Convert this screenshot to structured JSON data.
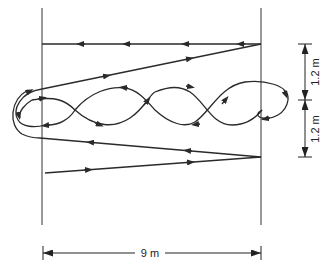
{
  "diagram": {
    "type": "movement-path-drill",
    "colors": {
      "line": "#2a2a2a",
      "background": "#ffffff"
    },
    "dimensions": {
      "width_label": "9 m",
      "upper_height_label": "1.2 m",
      "lower_height_label": "1.2 m"
    },
    "paths": [
      {
        "name": "top-return-line",
        "direction": "right-to-left",
        "arrow_count": 4
      },
      {
        "name": "upper-diagonal",
        "direction": "left-to-right",
        "arrow_count": 2
      },
      {
        "name": "figure-eight-weave",
        "loops": 3,
        "direction": "mixed"
      },
      {
        "name": "lower-return-diagonal",
        "direction": "right-to-left",
        "arrow_count": 2
      },
      {
        "name": "bottom-start-diagonal",
        "direction": "left-to-right",
        "arrow_count": 2
      }
    ]
  }
}
